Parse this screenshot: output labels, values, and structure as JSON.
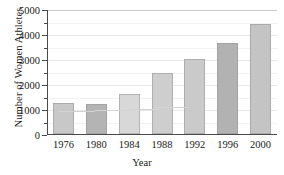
{
  "chart_data": {
    "type": "bar",
    "title": "",
    "xlabel": "Year",
    "ylabel": "Number of Women Athletes",
    "categories": [
      "1976",
      "1980",
      "1984",
      "1988",
      "1992",
      "1996",
      "2000"
    ],
    "values": [
      1250,
      1200,
      1600,
      2450,
      3000,
      3650,
      4400
    ],
    "ylim": [
      0,
      5000
    ],
    "ytick_labels": [
      "0",
      "1000",
      "2000",
      "3000",
      "4000",
      "5000"
    ],
    "ytick_values": [
      0,
      1000,
      2000,
      3000,
      4000,
      5000
    ],
    "yminor_values": [
      500,
      1500,
      2500,
      3500,
      4500
    ],
    "grid": true,
    "legend": "none",
    "bar_colors": [
      "#c8c8c8",
      "#b4b4b4",
      "#d8d8d8",
      "#cecece",
      "#cacaca",
      "#b2b2b2",
      "#c4c4c4"
    ],
    "axis_color": "#4a4a4a",
    "grid_color": "#e8e8e6",
    "text_color": "#1a1a1a",
    "background": "#ffffff",
    "annotation_line_color": "#d3d3d3"
  }
}
